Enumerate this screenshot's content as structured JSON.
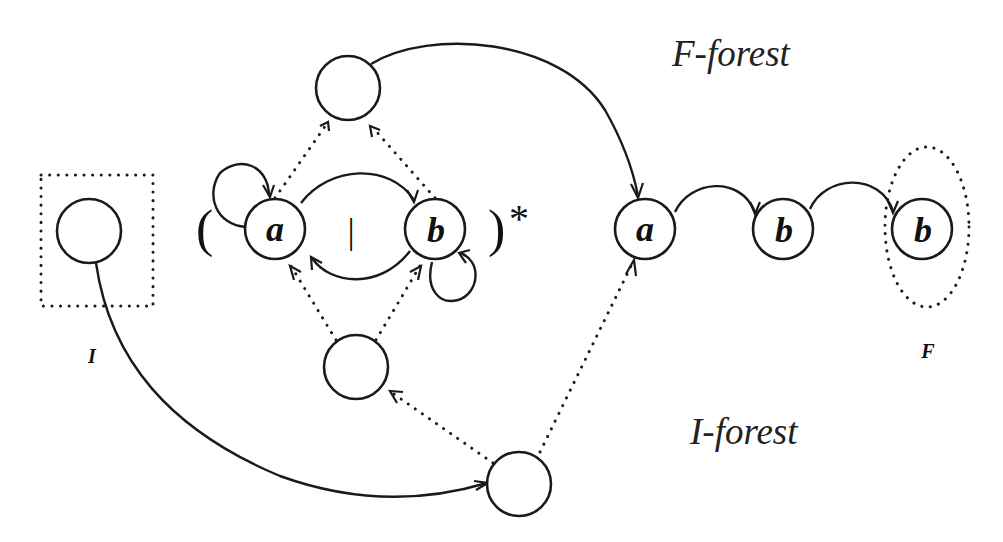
{
  "labels": {
    "f_forest": "F-forest",
    "i_forest": "I-forest",
    "initial_set": "I",
    "final_set": "F"
  },
  "expression": {
    "open_paren": "(",
    "close_paren": ")",
    "alternation": "|",
    "kleene_star": "*"
  },
  "left_group": {
    "node_a": "a",
    "node_b": "b"
  },
  "right_chain": {
    "nodes": [
      "a",
      "b",
      "b"
    ]
  },
  "colors": {
    "ink": "#1a1a1a",
    "background": "#ffffff"
  }
}
